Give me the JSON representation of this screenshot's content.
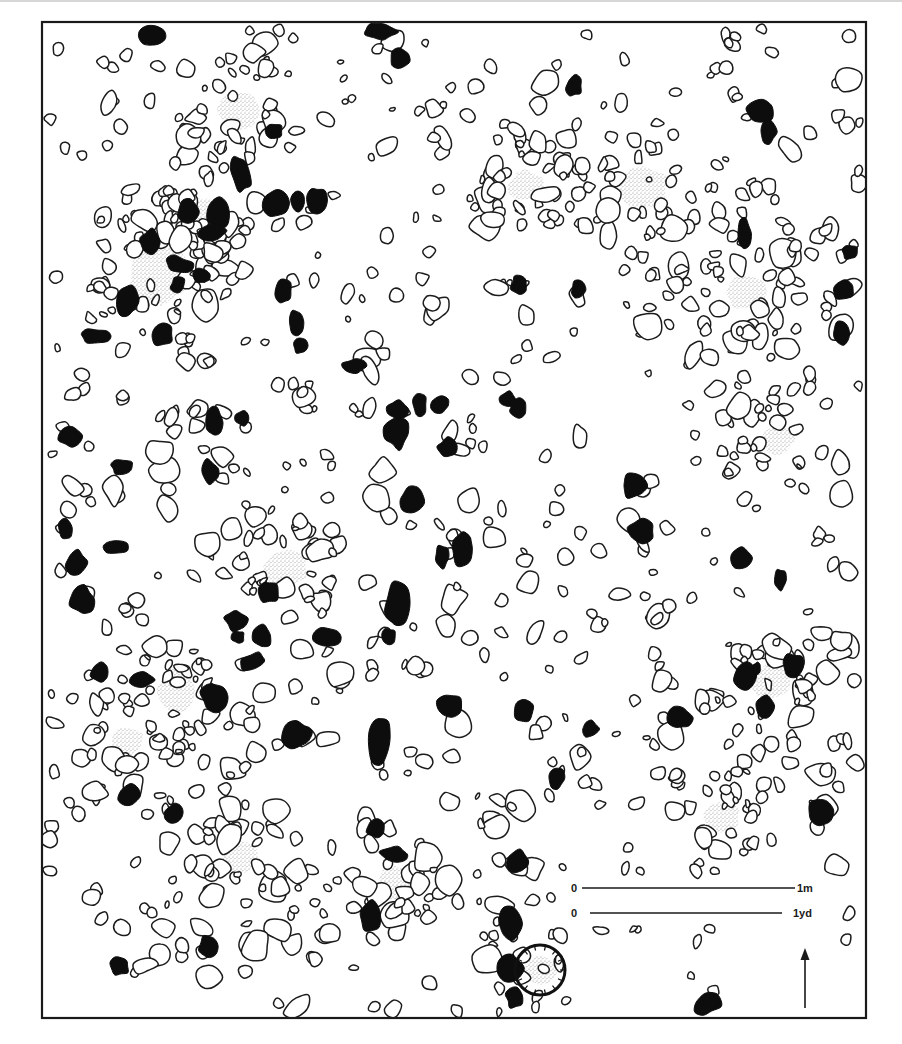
{
  "figure": {
    "frame": {
      "x": 42,
      "y": 22,
      "width": 824,
      "height": 996
    },
    "colors": {
      "line": "#1c1c1c",
      "dark_stone": "#0d0d0d",
      "stipple": "#9a9a9a",
      "background": "#ffffff"
    }
  },
  "scale_bar": {
    "metric": {
      "start_label": "0",
      "end_label": "1m",
      "x1": 582,
      "x2": 795,
      "y": 888
    },
    "imperial": {
      "start_label": "0",
      "end_label": "1yd",
      "x1": 590,
      "x2": 782,
      "y": 913
    }
  },
  "north_arrow": {
    "x": 805,
    "y_top": 950,
    "y_bottom": 1008,
    "direction": "north"
  },
  "legend_implicit": {
    "outlined_stone": "stone (outline)",
    "dark_stone": "burnt / dark stone (filled)",
    "stippled_patch": "hearth / ash patch (stippled)"
  },
  "hearths": [
    {
      "x": 240,
      "y": 110,
      "rx": 22,
      "ry": 18
    },
    {
      "x": 526,
      "y": 186,
      "rx": 17,
      "ry": 15
    },
    {
      "x": 643,
      "y": 188,
      "rx": 25,
      "ry": 20
    },
    {
      "x": 745,
      "y": 292,
      "rx": 20,
      "ry": 17
    },
    {
      "x": 160,
      "y": 275,
      "rx": 30,
      "ry": 28
    },
    {
      "x": 203,
      "y": 210,
      "rx": 12,
      "ry": 12
    },
    {
      "x": 778,
      "y": 440,
      "rx": 16,
      "ry": 14
    },
    {
      "x": 285,
      "y": 568,
      "rx": 22,
      "ry": 17
    },
    {
      "x": 176,
      "y": 690,
      "rx": 18,
      "ry": 24
    },
    {
      "x": 127,
      "y": 742,
      "rx": 16,
      "ry": 14
    },
    {
      "x": 770,
      "y": 682,
      "rx": 20,
      "ry": 18
    },
    {
      "x": 722,
      "y": 817,
      "rx": 17,
      "ry": 15
    },
    {
      "x": 240,
      "y": 858,
      "rx": 17,
      "ry": 17
    },
    {
      "x": 394,
      "y": 882,
      "rx": 16,
      "ry": 17
    },
    {
      "x": 540,
      "y": 970,
      "rx": 16,
      "ry": 14
    }
  ],
  "hearth_ring": {
    "x": 540,
    "y": 970,
    "r": 25
  },
  "dark_stones": [
    {
      "x": 152,
      "y": 36,
      "rx": 13,
      "ry": 10,
      "rot": 10
    },
    {
      "x": 380,
      "y": 32,
      "rx": 16,
      "ry": 8,
      "rot": 0
    },
    {
      "x": 400,
      "y": 58,
      "rx": 9,
      "ry": 10,
      "rot": 20
    },
    {
      "x": 574,
      "y": 86,
      "rx": 8,
      "ry": 10,
      "rot": 0
    },
    {
      "x": 760,
      "y": 112,
      "rx": 14,
      "ry": 11,
      "rot": 0
    },
    {
      "x": 768,
      "y": 132,
      "rx": 8,
      "ry": 12,
      "rot": 0
    },
    {
      "x": 274,
      "y": 131,
      "rx": 9,
      "ry": 8,
      "rot": 0
    },
    {
      "x": 241,
      "y": 173,
      "rx": 9,
      "ry": 18,
      "rot": -10
    },
    {
      "x": 188,
      "y": 212,
      "rx": 10,
      "ry": 12,
      "rot": 0
    },
    {
      "x": 218,
      "y": 214,
      "rx": 10,
      "ry": 15,
      "rot": 0
    },
    {
      "x": 213,
      "y": 233,
      "rx": 14,
      "ry": 8,
      "rot": -10
    },
    {
      "x": 276,
      "y": 203,
      "rx": 12,
      "ry": 13,
      "rot": 0
    },
    {
      "x": 298,
      "y": 203,
      "rx": 7,
      "ry": 11,
      "rot": 0
    },
    {
      "x": 316,
      "y": 200,
      "rx": 10,
      "ry": 13,
      "rot": 0
    },
    {
      "x": 150,
      "y": 242,
      "rx": 11,
      "ry": 12,
      "rot": 0
    },
    {
      "x": 128,
      "y": 300,
      "rx": 10,
      "ry": 17,
      "rot": 10
    },
    {
      "x": 180,
      "y": 265,
      "rx": 14,
      "ry": 8,
      "rot": 15
    },
    {
      "x": 202,
      "y": 275,
      "rx": 8,
      "ry": 7,
      "rot": 0
    },
    {
      "x": 178,
      "y": 285,
      "rx": 7,
      "ry": 8,
      "rot": 0
    },
    {
      "x": 284,
      "y": 291,
      "rx": 8,
      "ry": 12,
      "rot": 0
    },
    {
      "x": 95,
      "y": 336,
      "rx": 14,
      "ry": 7,
      "rot": 0
    },
    {
      "x": 162,
      "y": 334,
      "rx": 11,
      "ry": 11,
      "rot": 0
    },
    {
      "x": 296,
      "y": 322,
      "rx": 7,
      "ry": 12,
      "rot": 0
    },
    {
      "x": 300,
      "y": 346,
      "rx": 7,
      "ry": 8,
      "rot": 0
    },
    {
      "x": 354,
      "y": 366,
      "rx": 12,
      "ry": 7,
      "rot": 0
    },
    {
      "x": 519,
      "y": 285,
      "rx": 8,
      "ry": 9,
      "rot": 0
    },
    {
      "x": 578,
      "y": 290,
      "rx": 7,
      "ry": 9,
      "rot": 0
    },
    {
      "x": 744,
      "y": 234,
      "rx": 7,
      "ry": 14,
      "rot": 0
    },
    {
      "x": 850,
      "y": 252,
      "rx": 8,
      "ry": 7,
      "rot": 0
    },
    {
      "x": 843,
      "y": 290,
      "rx": 12,
      "ry": 9,
      "rot": 0
    },
    {
      "x": 842,
      "y": 333,
      "rx": 9,
      "ry": 12,
      "rot": 0
    },
    {
      "x": 70,
      "y": 436,
      "rx": 11,
      "ry": 11,
      "rot": 0
    },
    {
      "x": 122,
      "y": 467,
      "rx": 11,
      "ry": 7,
      "rot": 0
    },
    {
      "x": 215,
      "y": 423,
      "rx": 8,
      "ry": 15,
      "rot": 0
    },
    {
      "x": 243,
      "y": 418,
      "rx": 7,
      "ry": 7,
      "rot": 0
    },
    {
      "x": 210,
      "y": 472,
      "rx": 9,
      "ry": 12,
      "rot": -20
    },
    {
      "x": 65,
      "y": 528,
      "rx": 7,
      "ry": 12,
      "rot": 0
    },
    {
      "x": 115,
      "y": 547,
      "rx": 13,
      "ry": 6,
      "rot": 0
    },
    {
      "x": 76,
      "y": 562,
      "rx": 10,
      "ry": 12,
      "rot": 0
    },
    {
      "x": 82,
      "y": 600,
      "rx": 12,
      "ry": 14,
      "rot": 0
    },
    {
      "x": 397,
      "y": 410,
      "rx": 10,
      "ry": 9,
      "rot": 0
    },
    {
      "x": 420,
      "y": 405,
      "rx": 7,
      "ry": 12,
      "rot": 0
    },
    {
      "x": 440,
      "y": 405,
      "rx": 9,
      "ry": 8,
      "rot": 0
    },
    {
      "x": 397,
      "y": 433,
      "rx": 12,
      "ry": 15,
      "rot": 0
    },
    {
      "x": 447,
      "y": 448,
      "rx": 9,
      "ry": 10,
      "rot": 30
    },
    {
      "x": 508,
      "y": 400,
      "rx": 9,
      "ry": 8,
      "rot": 0
    },
    {
      "x": 518,
      "y": 408,
      "rx": 8,
      "ry": 9,
      "rot": 0
    },
    {
      "x": 412,
      "y": 500,
      "rx": 11,
      "ry": 12,
      "rot": 15
    },
    {
      "x": 442,
      "y": 557,
      "rx": 7,
      "ry": 11,
      "rot": 0
    },
    {
      "x": 462,
      "y": 548,
      "rx": 10,
      "ry": 18,
      "rot": 0
    },
    {
      "x": 397,
      "y": 605,
      "rx": 11,
      "ry": 22,
      "rot": 5
    },
    {
      "x": 389,
      "y": 637,
      "rx": 7,
      "ry": 9,
      "rot": 0
    },
    {
      "x": 634,
      "y": 486,
      "rx": 12,
      "ry": 12,
      "rot": 0
    },
    {
      "x": 640,
      "y": 531,
      "rx": 14,
      "ry": 11,
      "rot": 0
    },
    {
      "x": 740,
      "y": 558,
      "rx": 11,
      "ry": 11,
      "rot": 0
    },
    {
      "x": 780,
      "y": 580,
      "rx": 6,
      "ry": 11,
      "rot": 0
    },
    {
      "x": 268,
      "y": 592,
      "rx": 10,
      "ry": 11,
      "rot": 0
    },
    {
      "x": 236,
      "y": 620,
      "rx": 11,
      "ry": 10,
      "rot": 30
    },
    {
      "x": 262,
      "y": 636,
      "rx": 9,
      "ry": 12,
      "rot": 0
    },
    {
      "x": 252,
      "y": 662,
      "rx": 13,
      "ry": 8,
      "rot": -30
    },
    {
      "x": 238,
      "y": 637,
      "rx": 6,
      "ry": 6,
      "rot": 0
    },
    {
      "x": 328,
      "y": 637,
      "rx": 14,
      "ry": 10,
      "rot": 0
    },
    {
      "x": 100,
      "y": 672,
      "rx": 9,
      "ry": 10,
      "rot": 0
    },
    {
      "x": 141,
      "y": 680,
      "rx": 12,
      "ry": 8,
      "rot": 0
    },
    {
      "x": 214,
      "y": 697,
      "rx": 13,
      "ry": 14,
      "rot": 0
    },
    {
      "x": 296,
      "y": 734,
      "rx": 14,
      "ry": 14,
      "rot": 30
    },
    {
      "x": 379,
      "y": 738,
      "rx": 12,
      "ry": 24,
      "rot": 0
    },
    {
      "x": 450,
      "y": 705,
      "rx": 12,
      "ry": 11,
      "rot": 0
    },
    {
      "x": 524,
      "y": 710,
      "rx": 10,
      "ry": 12,
      "rot": 20
    },
    {
      "x": 590,
      "y": 729,
      "rx": 8,
      "ry": 8,
      "rot": 0
    },
    {
      "x": 556,
      "y": 778,
      "rx": 8,
      "ry": 11,
      "rot": 0
    },
    {
      "x": 680,
      "y": 718,
      "rx": 11,
      "ry": 11,
      "rot": 0
    },
    {
      "x": 745,
      "y": 676,
      "rx": 11,
      "ry": 14,
      "rot": 0
    },
    {
      "x": 793,
      "y": 665,
      "rx": 10,
      "ry": 11,
      "rot": 0
    },
    {
      "x": 765,
      "y": 706,
      "rx": 10,
      "ry": 11,
      "rot": 0
    },
    {
      "x": 757,
      "y": 668,
      "rx": 4,
      "ry": 6,
      "rot": 0
    },
    {
      "x": 820,
      "y": 814,
      "rx": 12,
      "ry": 14,
      "rot": -15
    },
    {
      "x": 129,
      "y": 796,
      "rx": 11,
      "ry": 11,
      "rot": 0
    },
    {
      "x": 174,
      "y": 813,
      "rx": 9,
      "ry": 10,
      "rot": 30
    },
    {
      "x": 376,
      "y": 829,
      "rx": 9,
      "ry": 9,
      "rot": 0
    },
    {
      "x": 395,
      "y": 855,
      "rx": 14,
      "ry": 8,
      "rot": 0
    },
    {
      "x": 370,
      "y": 917,
      "rx": 11,
      "ry": 15,
      "rot": 0
    },
    {
      "x": 518,
      "y": 862,
      "rx": 10,
      "ry": 11,
      "rot": 0
    },
    {
      "x": 510,
      "y": 924,
      "rx": 12,
      "ry": 16,
      "rot": 0
    },
    {
      "x": 510,
      "y": 968,
      "rx": 12,
      "ry": 14,
      "rot": 0
    },
    {
      "x": 515,
      "y": 998,
      "rx": 9,
      "ry": 10,
      "rot": 0
    },
    {
      "x": 208,
      "y": 946,
      "rx": 9,
      "ry": 11,
      "rot": 0
    },
    {
      "x": 120,
      "y": 966,
      "rx": 9,
      "ry": 9,
      "rot": 0
    },
    {
      "x": 707,
      "y": 1004,
      "rx": 14,
      "ry": 10,
      "rot": -20
    }
  ],
  "stone_seed": 7391,
  "stone_count": 1050
}
